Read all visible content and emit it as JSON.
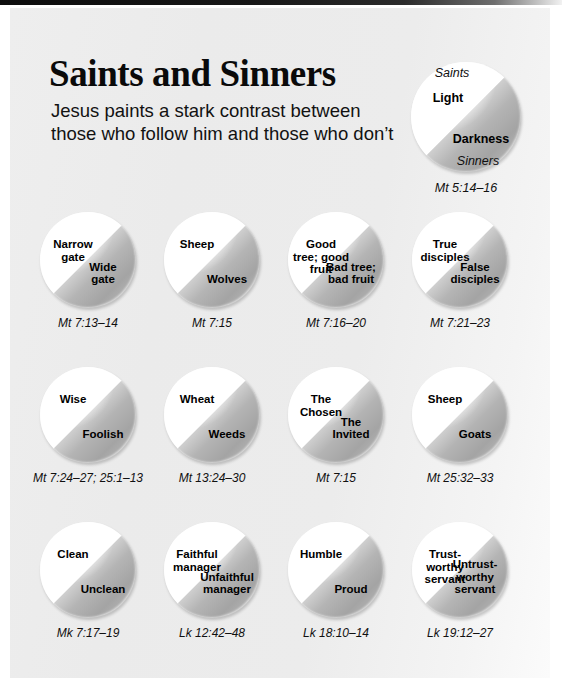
{
  "header": {
    "title": "Saints and Sinners",
    "subtitle": "Jesus paints a stark contrast between those who follow him and those who don’t"
  },
  "legend": {
    "caption_top": "Saints",
    "label_top": "Light",
    "label_bottom": "Darkness",
    "caption_bottom": "Sinners",
    "reference": "Mt 5:14–16"
  },
  "colors": {
    "page_background": "#ebebeb",
    "light_half": "#ffffff",
    "dark_half": "#a4a4a4",
    "text": "#000000"
  },
  "items": [
    {
      "label_top": "Narrow\ngate",
      "label_bottom": "Wide\ngate",
      "reference": "Mt 7:13–14"
    },
    {
      "label_top": "Sheep",
      "label_bottom": "Wolves",
      "reference": "Mt 7:15"
    },
    {
      "label_top": "Good\ntree; good\nfruit",
      "label_bottom": "Bad tree;\nbad fruit",
      "reference": "Mt 7:16–20"
    },
    {
      "label_top": "True\ndisciples",
      "label_bottom": "False\ndisciples",
      "reference": "Mt 7:21–23"
    },
    {
      "label_top": "Wise",
      "label_bottom": "Foolish",
      "reference": "Mt 7:24–27; 25:1–13"
    },
    {
      "label_top": "Wheat",
      "label_bottom": "Weeds",
      "reference": "Mt 13:24–30"
    },
    {
      "label_top": "The\nChosen",
      "label_bottom": "The\nInvited",
      "reference": "Mt 7:15"
    },
    {
      "label_top": "Sheep",
      "label_bottom": "Goats",
      "reference": "Mt 25:32–33"
    },
    {
      "label_top": "Clean",
      "label_bottom": "Unclean",
      "reference": "Mk 7:17–19"
    },
    {
      "label_top": "Faithful\nmanager",
      "label_bottom": "Unfaithful\nmanager",
      "reference": "Lk 12:42–48"
    },
    {
      "label_top": "Humble",
      "label_bottom": "Proud",
      "reference": "Lk 18:10–14"
    },
    {
      "label_top": "Trust-\nworthy\nservant",
      "label_bottom": "Untrust-\nworthy\nservant",
      "reference": "Lk 19:12–27"
    }
  ]
}
